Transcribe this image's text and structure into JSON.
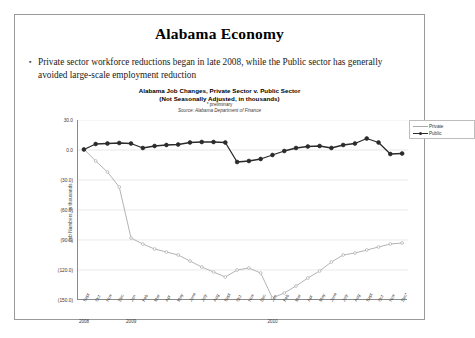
{
  "slide": {
    "title": "Alabama Economy",
    "bullet_marker": "▪",
    "bullet_text": "Private sector workforce reductions began in late 2008, while the Public sector has generally avoided large-scale employment reduction"
  },
  "chart_data": {
    "type": "line",
    "title": "Alabama Job Changes, Private Sector v. Public Sector",
    "subtitle": "(Not Seasonally Adjusted, in thousands)",
    "note": "* preliminary",
    "source": "Source: Alabama Department of Finance",
    "xlabel": "",
    "ylabel": "Job Numbers, in thousands",
    "ylim": [
      -150,
      30
    ],
    "yticks": [
      30,
      0,
      -30,
      -60,
      -90,
      -120,
      -150
    ],
    "ytick_labels": [
      "30.0",
      "0.0",
      "(30.0)",
      "(60.0)",
      "(90.0)",
      "(120.0)",
      "(150.0)"
    ],
    "grid": true,
    "legend_position": "top-right",
    "year_labels": [
      {
        "label": "2008",
        "index": 0
      },
      {
        "label": "2009",
        "index": 4
      },
      {
        "label": "2010",
        "index": 16
      }
    ],
    "categories": [
      "Sept",
      "Oct",
      "Nov",
      "Dec",
      "Jan",
      "Feb",
      "Mar",
      "Apr",
      "May",
      "June",
      "July",
      "Aug",
      "Sept",
      "Oct",
      "Nov",
      "Dec",
      "Jan",
      "Feb",
      "Mar",
      "Apr",
      "May",
      "June",
      "July",
      "Aug",
      "Sept",
      "Oct",
      "Nov",
      "Dec*"
    ],
    "series": [
      {
        "name": "Private",
        "color": "#aaaaaa",
        "values": [
          1.0,
          -11.0,
          -22.0,
          -37.0,
          -88.0,
          -94.0,
          -99.0,
          -102.0,
          -105.0,
          -111.0,
          -117.0,
          -122.0,
          -127.0,
          -120.0,
          -118.0,
          -123.0,
          -148.0,
          -143.0,
          -136.0,
          -128.0,
          -121.0,
          -112.0,
          -105.0,
          -103.0,
          -100.0,
          -97.0,
          -94.0,
          -93.0
        ]
      },
      {
        "name": "Public",
        "color": "#2b2b2b",
        "values": [
          0.5,
          6.0,
          6.5,
          7.0,
          6.5,
          2.0,
          4.0,
          5.0,
          5.5,
          7.5,
          8.0,
          8.0,
          7.5,
          -12.0,
          -11.0,
          -9.0,
          -5.0,
          -1.0,
          2.0,
          3.5,
          4.0,
          2.0,
          5.0,
          6.5,
          11.5,
          7.5,
          -4.0,
          -3.5
        ]
      }
    ]
  }
}
